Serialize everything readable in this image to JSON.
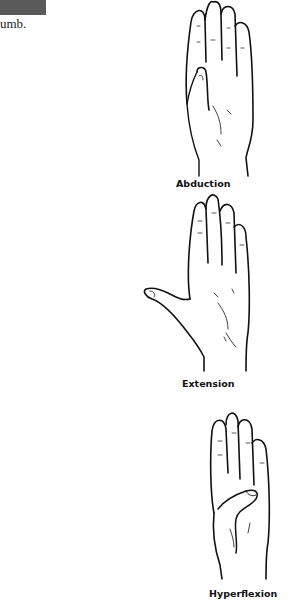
{
  "header": {
    "bar_color": "#5a5a5a"
  },
  "text_snippet": "umb.",
  "figures": [
    {
      "caption": "Abduction",
      "icon": "hand-thumb-abduction-icon"
    },
    {
      "caption": "Extension",
      "icon": "hand-thumb-extension-icon"
    },
    {
      "caption": "Hyperflexion",
      "icon": "hand-thumb-hyperflexion-icon"
    }
  ]
}
